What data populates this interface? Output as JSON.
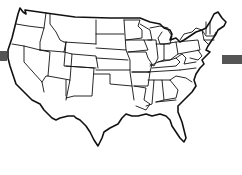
{
  "map": {
    "title": "Contiguous United States outline map",
    "style": "black state borders on white",
    "colors": {
      "background": "#ffffff",
      "stroke": "#111111",
      "bar": "#555555"
    },
    "bars": [
      {
        "side": "left",
        "x": 0,
        "y": 51,
        "width": 7,
        "height": 10
      },
      {
        "side": "right",
        "x": 222,
        "y": 55,
        "width": 20,
        "height": 9
      }
    ]
  }
}
